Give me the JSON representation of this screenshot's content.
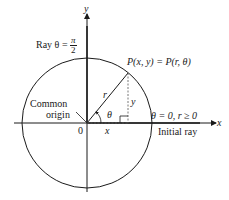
{
  "diagram": {
    "type": "polar-coordinates",
    "axes": {
      "x_label": "x",
      "y_label": "y"
    },
    "origin_label": "0",
    "common_origin_label": {
      "line1": "Common",
      "line2": "origin"
    },
    "ray_pi_over_2": {
      "prefix": "Ray θ = ",
      "numerator": "π",
      "denominator": "2"
    },
    "point_label": "P(x, y) = P(r, θ)",
    "radius_label": "r",
    "angle_label": "θ",
    "x_segment_label": "x",
    "y_segment_label": "y",
    "initial_ray": {
      "condition": "θ = 0, r ≥ 0",
      "label": "Initial ray"
    },
    "colors": {
      "ink": "#1a1a1a",
      "background": "#ffffff"
    }
  }
}
